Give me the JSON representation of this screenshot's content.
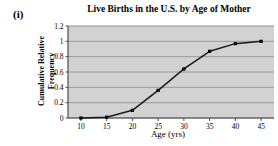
{
  "figure": {
    "item_label": "(i)",
    "background_color": "#ffffff"
  },
  "chart_data": {
    "type": "line",
    "title": "Live Births in the U.S. by Age of Mother",
    "xlabel": "Age (yrs)",
    "ylabel": "Cumulative Relative Frequency",
    "x": [
      10,
      15,
      20,
      25,
      30,
      35,
      40,
      45
    ],
    "values": [
      0.0,
      0.01,
      0.1,
      0.36,
      0.64,
      0.87,
      0.97,
      1.0
    ],
    "xtick_labels": [
      "10",
      "15",
      "20",
      "25",
      "30",
      "35",
      "40",
      "45"
    ],
    "ytick_labels": [
      "0",
      "0.2",
      "0.4",
      "0.6",
      "0.8",
      "1",
      "1.2"
    ],
    "ytick_values": [
      0,
      0.2,
      0.4,
      0.6,
      0.8,
      1,
      1.2
    ],
    "xlim": [
      7.5,
      47.5
    ],
    "ylim": [
      0,
      1.2
    ],
    "grid": "horizontal",
    "legend": "none",
    "marker": "square",
    "line_color": "#1a1a1a",
    "marker_color": "#000000",
    "plot_background_color": "#d2d2d2",
    "gridline_color": "#8c8c8c",
    "axis_color": "#4d4d4d"
  }
}
